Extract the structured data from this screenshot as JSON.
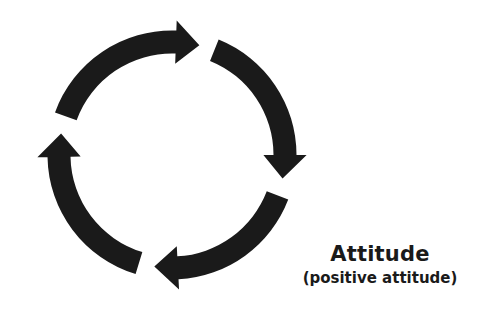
{
  "diagram": {
    "type": "cycle",
    "arrow_color": "#1a1a1a",
    "background": "#ffffff",
    "center": [
      172,
      155
    ],
    "radius": 113,
    "thickness": 23,
    "arrows": [
      {
        "name": "arrow-top",
        "start_deg": -160,
        "end_deg": -76
      },
      {
        "name": "arrow-right",
        "start_deg": -68,
        "end_deg": 12
      },
      {
        "name": "arrow-bottom",
        "start_deg": 21,
        "end_deg": 99
      },
      {
        "name": "arrow-left",
        "start_deg": 107,
        "end_deg": 191
      }
    ]
  },
  "label": {
    "title": "Attitude",
    "subtitle": "(positive attitude)"
  }
}
